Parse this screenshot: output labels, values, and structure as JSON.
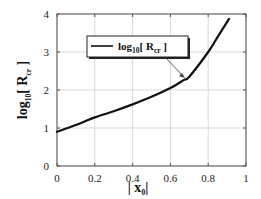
{
  "chart_data": {
    "type": "line",
    "title": "",
    "xlabel": "| x0 |",
    "ylabel": "log10[ Rcr ]",
    "xlim": [
      0,
      1
    ],
    "ylim": [
      0,
      4
    ],
    "grid": true,
    "x_ticks": [
      "0",
      "0.2",
      "0.4",
      "0.6",
      "0.8",
      "1"
    ],
    "y_ticks": [
      "0",
      "1",
      "2",
      "3",
      "4"
    ],
    "legend": {
      "position": "upper-left-center, with arrow pointing to curve",
      "entries": [
        "log10[ Rcr ]"
      ]
    },
    "series": [
      {
        "name": "log10[ Rcr ]",
        "color": "#111111",
        "x": [
          0.0,
          0.1,
          0.2,
          0.3,
          0.4,
          0.5,
          0.6,
          0.67,
          0.7,
          0.8,
          0.85,
          0.91
        ],
        "y": [
          0.9,
          1.08,
          1.28,
          1.44,
          1.62,
          1.82,
          2.05,
          2.26,
          2.35,
          3.0,
          3.4,
          3.87
        ]
      }
    ]
  },
  "labels": {
    "y_axis_main": "log",
    "y_axis_sub": "10",
    "y_axis_bracket_open": "[ R",
    "y_axis_sub2": "cr",
    "y_axis_bracket_close": " ]",
    "x_axis_main": "| x",
    "x_axis_sub": "0",
    "x_axis_close": "|",
    "legend_main": "log",
    "legend_sub": "10",
    "legend_bracket_open": "[  R",
    "legend_sub2": "cr",
    "legend_bracket_close": " ]"
  },
  "colors": {
    "line": "#111111",
    "grid": "#d9d9d9",
    "axis": "#444444"
  }
}
